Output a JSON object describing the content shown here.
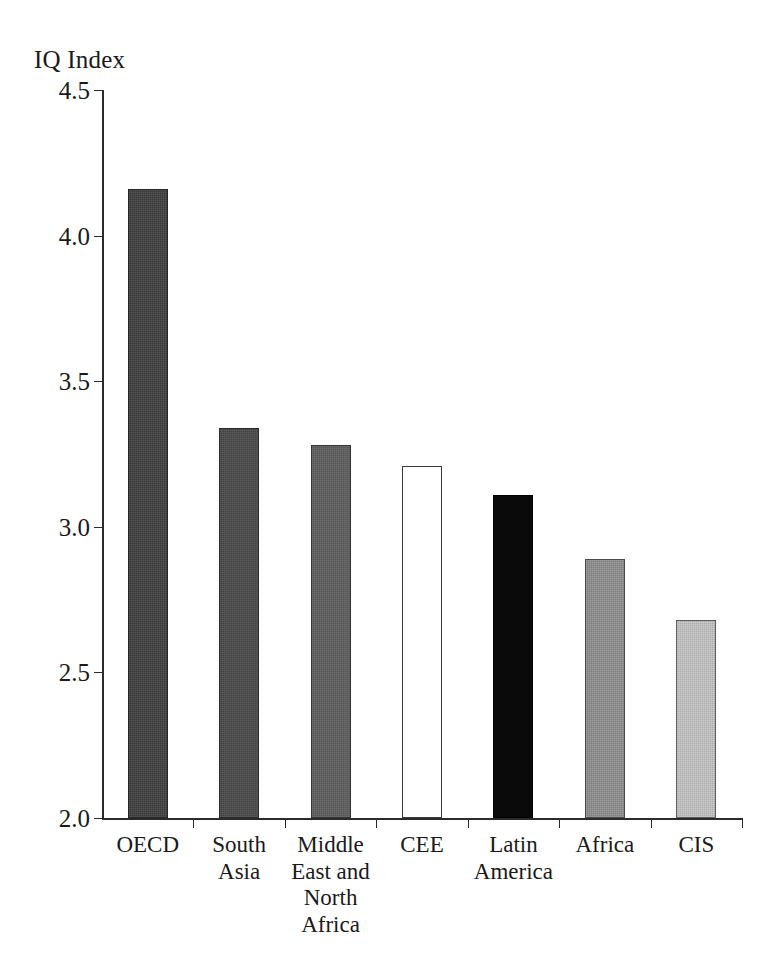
{
  "chart_data": {
    "type": "bar",
    "title": "",
    "subtitle": "",
    "xlabel": "",
    "ylabel": "IQ Index",
    "ylim": [
      2.0,
      4.5
    ],
    "yticks": [
      "2.0",
      "2.5",
      "3.0",
      "3.5",
      "4.0",
      "4.5"
    ],
    "ytick_values": [
      2.0,
      2.5,
      3.0,
      3.5,
      4.0,
      4.5
    ],
    "grid": false,
    "legend": "none",
    "categories": [
      "OECD",
      "South\nAsia",
      "Middle\nEast and\nNorth\nAfrica",
      "CEE",
      "Latin\nAmerica",
      "Africa",
      "CIS"
    ],
    "values": [
      4.16,
      3.34,
      3.28,
      3.21,
      3.11,
      2.89,
      2.68
    ],
    "bar_styles": [
      "fill-darkgray",
      "fill-darkgray2",
      "fill-midgray",
      "fill-white",
      "fill-black",
      "fill-gray",
      "fill-lightgray"
    ],
    "bar_colors": [
      "#3a3a3a",
      "#434343",
      "#555555",
      "#ffffff",
      "#0a0a0a",
      "#808080",
      "#b0b0b0"
    ]
  },
  "axis": {
    "line_color": "#2b2b2b"
  }
}
